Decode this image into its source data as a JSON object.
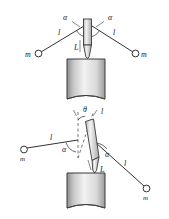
{
  "figure": {
    "background_color": "#ffffff",
    "stroke_color": "#333333",
    "width": 169,
    "height": 219,
    "panels": [
      {
        "id": "panel-top",
        "description": "vertical-rod-symmetric-case",
        "rod": {
          "orientation": "vertical",
          "length_label": "L"
        },
        "strings": [
          {
            "side": "left",
            "length_label": "l",
            "angle_label": "α"
          },
          {
            "side": "right",
            "length_label": "l",
            "angle_label": "α"
          }
        ],
        "masses": [
          {
            "side": "left",
            "label": "m"
          },
          {
            "side": "right",
            "label": "m"
          }
        ],
        "cylinder": {
          "shading": "gradient-gray"
        }
      },
      {
        "id": "panel-bottom",
        "description": "tilted-rod-case",
        "rod": {
          "orientation": "tilted",
          "length_label": "L",
          "tilt_angle_label": "θ"
        },
        "strings": [
          {
            "side": "left",
            "length_label": "l",
            "angle_label": "α"
          },
          {
            "side": "right",
            "length_label": "l",
            "angle_label": "α"
          }
        ],
        "masses": [
          {
            "side": "left",
            "label": "m"
          },
          {
            "side": "right",
            "label": "m"
          }
        ],
        "cylinder": {
          "shading": "gradient-gray"
        },
        "vertical_reference": {
          "style": "dashed"
        }
      }
    ]
  },
  "labels": {
    "alpha": "α",
    "theta": "θ",
    "ell": "l",
    "L": "L",
    "m": "m"
  }
}
